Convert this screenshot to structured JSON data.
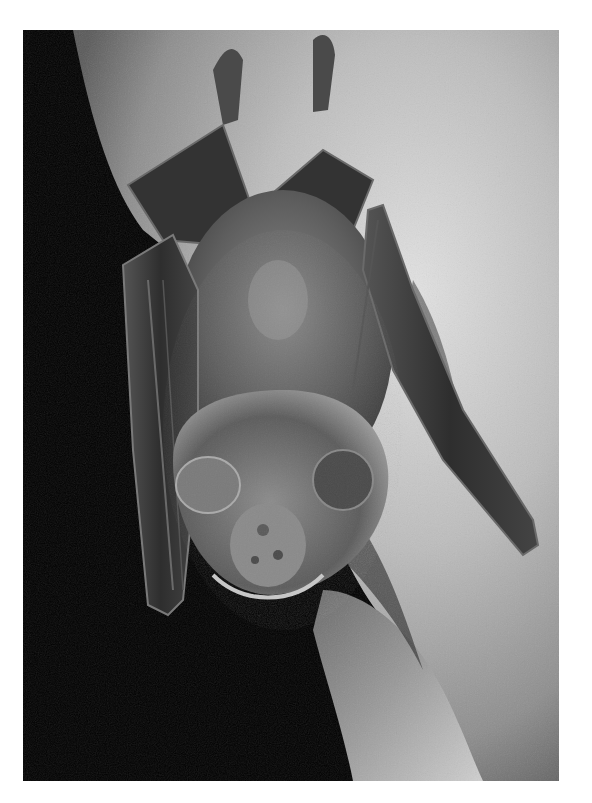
{
  "image": {
    "subject": "Bat hanging upside-down on a rock",
    "alt": "Grayscale photograph of a bat hanging upside-down from a rock surface, wings folded, dark background on the left",
    "colors": {
      "border": "#ffffff",
      "background_dark": "#000000",
      "rock_light": "#d8d8d8",
      "rock_mid": "#9a9a9a",
      "fur": "#6e6e6e",
      "wing_membrane": "#3a3a3a"
    },
    "frame": {
      "left": 23,
      "top": 30,
      "width": 536,
      "height": 751
    }
  }
}
